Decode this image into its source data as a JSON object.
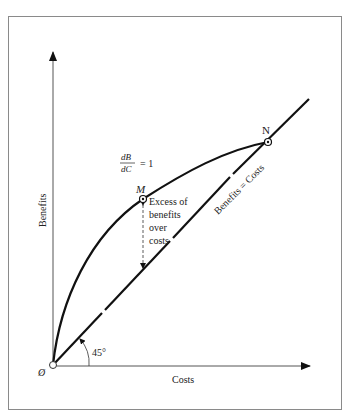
{
  "diagram": {
    "axes": {
      "x_label": "Costs",
      "y_label": "Benefits",
      "origin_label": "Ø"
    },
    "lines": {
      "diagonal_label": "Benefits = Costs",
      "angle_label": "45°"
    },
    "points": {
      "m_label": "M",
      "n_label": "N"
    },
    "annotations": {
      "derivative_numerator": "dB",
      "derivative_denominator": "dC",
      "derivative_equals": "= 1",
      "excess_line1": "Excess of",
      "excess_line2": "benefits",
      "excess_line3": "over",
      "excess_line4": "costs"
    },
    "colors": {
      "ink": "#111111",
      "axis": "#555555",
      "frame": "#8a8a8a",
      "background": "#ffffff"
    }
  }
}
